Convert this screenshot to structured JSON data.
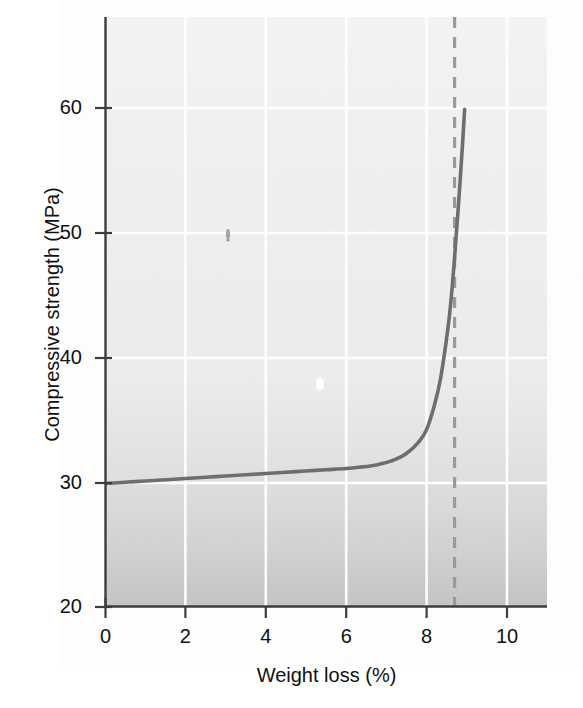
{
  "chart_data": {
    "type": "line",
    "title": "",
    "subtitle": "",
    "xlabel": "Weight loss (%)",
    "ylabel": "Compressive strength (MPa)",
    "xlim": [
      0,
      11
    ],
    "ylim": [
      20,
      66
    ],
    "xticks": [
      0,
      2,
      4,
      6,
      8,
      10
    ],
    "xtick_labels": [
      "0",
      "2",
      "4",
      "6",
      "8",
      "10"
    ],
    "yticks": [
      20,
      30,
      40,
      50,
      60
    ],
    "ytick_labels": [
      "20",
      "30",
      "40",
      "50",
      "60"
    ],
    "grid": true,
    "grid_color": "#ffffff",
    "legend": "none",
    "plot_bgcolor_top": "#f2f2f2",
    "plot_bgcolor_bottom": "#c9c9c9",
    "series": [
      {
        "name": "Compressive strength vs weight loss",
        "style": "solid",
        "color": "#6e6e6e",
        "x": [
          0.0,
          0.5,
          1.0,
          1.5,
          2.0,
          2.5,
          3.0,
          3.5,
          4.0,
          4.5,
          5.0,
          5.5,
          6.0,
          6.3,
          6.6,
          6.9,
          7.2,
          7.5,
          7.8,
          8.0,
          8.2,
          8.35,
          8.5,
          8.6,
          8.7,
          8.8,
          8.9,
          8.95
        ],
        "y": [
          29.9,
          30.0,
          30.1,
          30.2,
          30.3,
          30.4,
          30.5,
          30.6,
          30.7,
          30.8,
          30.9,
          31.0,
          31.1,
          31.2,
          31.3,
          31.5,
          31.8,
          32.3,
          33.2,
          34.2,
          36.2,
          38.3,
          41.5,
          44.2,
          48.0,
          52.4,
          57.2,
          59.9
        ]
      }
    ],
    "annotations": [
      {
        "name": "critical-weight-loss-line",
        "type": "vertical-dashed-line",
        "x": 8.7,
        "color": "#9a9a9a",
        "style": "dashed"
      }
    ]
  },
  "axes": {
    "x_label": "Weight loss (%)",
    "y_label": "Compressive strength (MPa)"
  },
  "ticks": {
    "x": [
      "0",
      "2",
      "4",
      "6",
      "8",
      "10"
    ],
    "y": [
      "20",
      "30",
      "40",
      "50",
      "60"
    ]
  },
  "colors": {
    "curve": "#6e6e6e",
    "dashed_line": "#9a9a9a",
    "grid": "#ffffff",
    "axis": "#3a3a3a",
    "text": "#111111",
    "bg_top": "#f2f2f2",
    "bg_bottom": "#c9c9c9"
  }
}
